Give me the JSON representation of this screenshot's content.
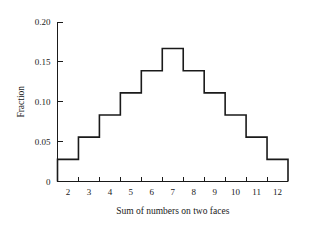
{
  "chart_data": {
    "type": "bar",
    "title": "",
    "subtitle": "",
    "xlabel": "Sum of numbers on two faces",
    "ylabel": "Fraction",
    "categories": [
      "2",
      "3",
      "4",
      "5",
      "6",
      "7",
      "8",
      "9",
      "10",
      "11",
      "12"
    ],
    "values": [
      0.0278,
      0.0556,
      0.0833,
      0.1111,
      0.1389,
      0.1667,
      0.1389,
      0.1111,
      0.0833,
      0.0556,
      0.0278
    ],
    "xlim": [
      1.5,
      12.5
    ],
    "ylim": [
      0,
      0.2
    ],
    "ytick_labels": [
      "0",
      "0.05",
      "0.10",
      "0.15",
      "0.20"
    ],
    "ytick_values": [
      0,
      0.05,
      0.1,
      0.15,
      0.2
    ],
    "xtick_label_positions": [
      2,
      3,
      4,
      5,
      6,
      7,
      8,
      9,
      10,
      11,
      12
    ],
    "xtick_mark_positions": [
      2.5,
      3.5,
      4.5,
      5.5,
      6.5,
      7.5,
      8.5,
      9.5,
      10.5,
      11.5
    ],
    "grid": false,
    "legend": false,
    "legend_position": "none",
    "style": "step-outline-histogram",
    "line_color": "#1a1a1a",
    "background_color": "#ffffff",
    "axes": {
      "left_spine": true,
      "bottom_spine": true,
      "top_spine": false,
      "right_spine": false,
      "tick_direction": "in"
    }
  }
}
